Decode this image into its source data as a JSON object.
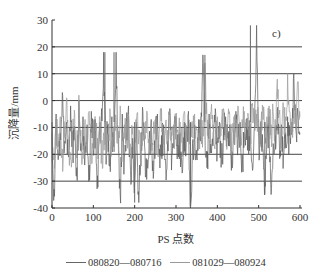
{
  "chart_data": {
    "type": "line",
    "panel_label": "c)",
    "title": "",
    "xlabel": "PS 点数",
    "ylabel": "沉降量/mm",
    "xlim": [
      0,
      600
    ],
    "ylim": [
      -40,
      30
    ],
    "x_ticks": [
      0,
      100,
      200,
      300,
      400,
      500,
      600
    ],
    "y_ticks": [
      30,
      20,
      10,
      0,
      -10,
      -20,
      -30,
      -40
    ],
    "grid": {
      "horizontal_lines_at": [
        20,
        10,
        0,
        -10,
        -20,
        -30
      ],
      "vertical": false
    },
    "legend_position": "bottom",
    "x": [
      0,
      5,
      10,
      15,
      20,
      25,
      30,
      35,
      40,
      45,
      50,
      55,
      60,
      65,
      70,
      75,
      80,
      85,
      90,
      95,
      100,
      105,
      110,
      115,
      120,
      125,
      130,
      135,
      140,
      145,
      150,
      155,
      160,
      165,
      170,
      175,
      180,
      185,
      190,
      195,
      200,
      205,
      210,
      215,
      220,
      225,
      230,
      235,
      240,
      245,
      250,
      255,
      260,
      265,
      270,
      275,
      280,
      285,
      290,
      295,
      300,
      305,
      310,
      315,
      320,
      325,
      330,
      335,
      340,
      345,
      350,
      355,
      360,
      365,
      370,
      375,
      380,
      385,
      390,
      395,
      400,
      405,
      410,
      415,
      420,
      425,
      430,
      435,
      440,
      445,
      450,
      455,
      460,
      465,
      470,
      475,
      480,
      485,
      490,
      495,
      500,
      505,
      510,
      515,
      520,
      525,
      530,
      535,
      540,
      545,
      550,
      555,
      560,
      565,
      570,
      575,
      580,
      585,
      590,
      595,
      600
    ],
    "series": [
      {
        "name": "080820—080716",
        "color": "#5a5a5a",
        "values": [
          -8,
          -33,
          -5,
          -22,
          -12,
          3,
          -18,
          -8,
          -21,
          -2,
          -14,
          -10,
          -25,
          0,
          -16,
          -6,
          -19,
          -9,
          -24,
          -4,
          -13,
          -7,
          -28,
          -11,
          -3,
          18,
          -15,
          -9,
          -20,
          -6,
          -17,
          18,
          -12,
          -35,
          -5,
          -21,
          -10,
          -2,
          -26,
          -14,
          -30,
          -8,
          -38,
          -12,
          -4,
          -19,
          -22,
          -16,
          -7,
          -29,
          -11,
          -5,
          -18,
          -13,
          -9,
          -24,
          -15,
          -3,
          -20,
          -10,
          -6,
          -17,
          -12,
          -27,
          -8,
          -14,
          -4,
          -40,
          -16,
          -9,
          -21,
          -7,
          -13,
          17,
          -10,
          -25,
          -5,
          -18,
          -12,
          -3,
          -16,
          -8,
          -22,
          -10,
          -6,
          -14,
          -9,
          -19,
          -11,
          -4,
          -15,
          -8,
          -20,
          -12,
          -7,
          -13,
          -9,
          -26,
          -10,
          28,
          -14,
          -8,
          -18,
          -30,
          -12,
          -6,
          -35,
          -16,
          -10,
          -4,
          -15,
          -9,
          -20,
          -12,
          -6,
          -13,
          -8,
          10,
          -11,
          -5,
          -12
        ]
      },
      {
        "name": "081029—080924",
        "color": "#9a9a9a",
        "values": [
          -12,
          -20,
          -8,
          -15,
          -6,
          -18,
          -10,
          1,
          -14,
          -22,
          -9,
          -5,
          -16,
          2,
          -11,
          -19,
          -7,
          -13,
          -4,
          -17,
          -10,
          -8,
          -14,
          -6,
          -20,
          -12,
          -9,
          -15,
          -3,
          -18,
          -11,
          -7,
          -13,
          -2,
          -16,
          -9,
          -12,
          -5,
          -17,
          -10,
          -14,
          -6,
          -11,
          -18,
          -8,
          -13,
          -4,
          -15,
          -9,
          -12,
          -7,
          -16,
          -10,
          -3,
          -14,
          -8,
          -11,
          -5,
          -13,
          -9,
          -6,
          -12,
          -8,
          -15,
          -4,
          -10,
          -7,
          -13,
          -9,
          -5,
          -11,
          -14,
          -6,
          -10,
          14,
          -8,
          -12,
          -4,
          -9,
          -11,
          -6,
          -13,
          -7,
          -3,
          -10,
          -8,
          -5,
          -12,
          -6,
          -9,
          -2,
          -11,
          -7,
          -4,
          -10,
          -6,
          -8,
          -1,
          -9,
          -5,
          -7,
          -11,
          -3,
          -8,
          -6,
          -2,
          -9,
          -4,
          -7,
          8,
          -5,
          -10,
          -3,
          -6,
          10,
          -4,
          -8,
          -2,
          -7,
          7,
          -6
        ]
      }
    ],
    "notable_peaks": [
      {
        "x": 128,
        "y": 18
      },
      {
        "x": 150,
        "y": 18
      },
      {
        "x": 370,
        "y": 17
      },
      {
        "x": 480,
        "y": 28
      },
      {
        "x": 335,
        "y": -40
      },
      {
        "x": 200,
        "y": -38
      },
      {
        "x": 515,
        "y": -35
      }
    ]
  },
  "legend": {
    "items": [
      {
        "label": "080820—080716"
      },
      {
        "label": "081029—080924"
      }
    ]
  }
}
